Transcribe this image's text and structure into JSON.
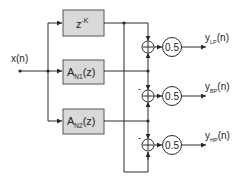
{
  "diagram": {
    "type": "block-diagram",
    "input": {
      "label": "x(n)"
    },
    "blocks": [
      {
        "id": "delay",
        "base": "z",
        "sup": "-K",
        "sub": "",
        "suffix": ""
      },
      {
        "id": "allpass1",
        "base": "A",
        "sub": "N1",
        "suffix": "(z)"
      },
      {
        "id": "allpass2",
        "base": "A",
        "sub": "N2",
        "suffix": "(z)"
      }
    ],
    "adders": [
      {
        "id": "adder-lp",
        "symbol": "+",
        "sign_label": ""
      },
      {
        "id": "adder-bp",
        "symbol": "+",
        "sign_label": "-"
      },
      {
        "id": "adder-hp",
        "symbol": "+",
        "sign_label": "-"
      }
    ],
    "gains": [
      {
        "id": "gain-lp",
        "value": "0.5"
      },
      {
        "id": "gain-bp",
        "value": "0.5"
      },
      {
        "id": "gain-hp",
        "value": "0.5"
      }
    ],
    "outputs": [
      {
        "id": "lp",
        "base": "y",
        "sub": "LP",
        "suffix": "(n)"
      },
      {
        "id": "bp",
        "base": "y",
        "sub": "BP",
        "suffix": "(n)"
      },
      {
        "id": "hp",
        "base": "y",
        "sub": "HP",
        "suffix": "(n)"
      }
    ],
    "colors": {
      "block_fill": "#d9d9d9",
      "line": "#2a2a2a",
      "background": "#ffffff"
    }
  }
}
